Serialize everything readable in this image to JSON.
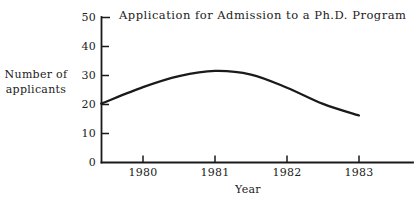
{
  "figure": {
    "title": "Application for Admission to a Ph.D. Program",
    "y_axis_title_line1": "Number of",
    "y_axis_title_line2": "applicants",
    "x_axis_title": "Year"
  },
  "chart_data": {
    "type": "line",
    "title": "Application for Admission to a Ph.D. Program",
    "xlabel": "Year",
    "ylabel": "Number of applicants",
    "x_tick_labels": [
      "1980",
      "1981",
      "1982",
      "1983"
    ],
    "y_tick_labels": [
      "50",
      "40",
      "30",
      "20",
      "10",
      "0"
    ],
    "ylim": [
      0,
      50
    ],
    "xlim_years": [
      1979.42,
      1983.75
    ],
    "grid": false,
    "legend": "none",
    "line_color": "#1a1a1a",
    "background_color": "#ffffff",
    "series": [
      {
        "name": "Number of applicants",
        "points": [
          {
            "year": 1979.42,
            "value": 20.3
          },
          {
            "year": 1980.0,
            "value": 26.0
          },
          {
            "year": 1980.5,
            "value": 29.8
          },
          {
            "year": 1981.0,
            "value": 31.6
          },
          {
            "year": 1981.5,
            "value": 30.3
          },
          {
            "year": 1982.0,
            "value": 25.8
          },
          {
            "year": 1982.5,
            "value": 20.2
          },
          {
            "year": 1983.0,
            "value": 16.2
          }
        ]
      }
    ],
    "year_readings": {
      "1980": 26,
      "1981": 31.5,
      "1982": 26,
      "1983": 16
    },
    "peak": {
      "year": 1981,
      "value": 31.5
    }
  }
}
